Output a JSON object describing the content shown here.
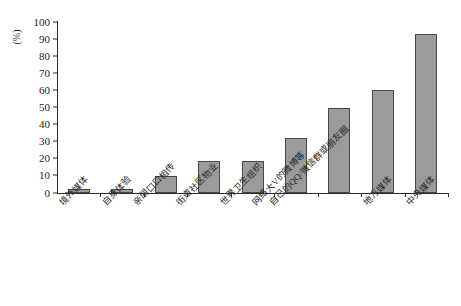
{
  "chart_data": {
    "type": "bar",
    "title": "",
    "subtitle": "",
    "xlabel": "",
    "ylabel": "(%)",
    "ylim": [
      0,
      100
    ],
    "grid": false,
    "legend": null,
    "y_ticks": [
      0,
      10,
      20,
      30,
      40,
      50,
      60,
      70,
      80,
      90,
      100
    ],
    "y_tick_labels": [
      "0",
      "10",
      "20",
      "30",
      "40",
      "50",
      "60",
      "70",
      "80",
      "90",
      "100"
    ],
    "categories": [
      "境外媒体",
      "自身体验",
      "亲朋口口相传",
      "街道社区物业",
      "世界卫生组织",
      "网络大V的微博等",
      "自己的QQ/微信群或朋友圈",
      "地方媒体",
      "中央媒体"
    ],
    "values": [
      2.5,
      2.5,
      10,
      19,
      19,
      32,
      50,
      60,
      93
    ],
    "bar_fill_color": "#9b9b9b",
    "bar_border_color": "#474747",
    "axis_color": "#2b2b2b"
  }
}
